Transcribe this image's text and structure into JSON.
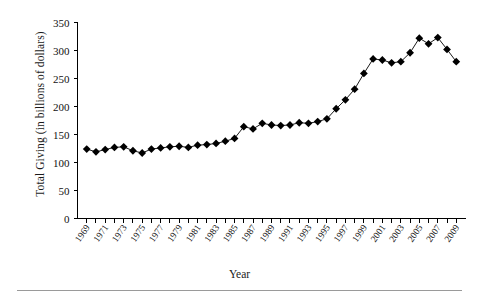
{
  "chart_data": {
    "type": "line",
    "title": "",
    "xlabel": "Year",
    "ylabel": "Total Giving (in billions of dollars)",
    "xlim": [
      1968,
      2010
    ],
    "ylim": [
      0,
      350
    ],
    "grid": false,
    "legend": null,
    "marker": "filled-diamond",
    "line_color": "#000000",
    "marker_color": "#000000",
    "y_ticks": [
      0,
      50,
      100,
      150,
      200,
      250,
      300,
      350
    ],
    "y_tick_labels": [
      "0",
      "50",
      "100",
      "150",
      "200",
      "250",
      "300",
      "350"
    ],
    "x_tick_labels": [
      "1969",
      "1971",
      "1973",
      "1975",
      "1977",
      "1979",
      "1981",
      "1983",
      "1985",
      "1987",
      "1989",
      "1991",
      "1993",
      "1995",
      "1997",
      "1999",
      "2001",
      "2003",
      "2005",
      "2007",
      "2009"
    ],
    "x_minor_tick_years": [
      1969,
      1970,
      1971,
      1972,
      1973,
      1974,
      1975,
      1976,
      1977,
      1978,
      1979,
      1980,
      1981,
      1982,
      1983,
      1984,
      1985,
      1986,
      1987,
      1988,
      1989,
      1990,
      1991,
      1992,
      1993,
      1994,
      1995,
      1996,
      1997,
      1998,
      1999,
      2000,
      2001,
      2002,
      2003,
      2004,
      2005,
      2006,
      2007,
      2008,
      2009
    ],
    "x": [
      1969,
      1970,
      1971,
      1972,
      1973,
      1974,
      1975,
      1976,
      1977,
      1978,
      1979,
      1980,
      1981,
      1982,
      1983,
      1984,
      1985,
      1986,
      1987,
      1988,
      1989,
      1990,
      1991,
      1992,
      1993,
      1994,
      1995,
      1996,
      1997,
      1998,
      1999,
      2000,
      2001,
      2002,
      2003,
      2004,
      2005,
      2006,
      2007,
      2008,
      2009
    ],
    "values": [
      124,
      119,
      123,
      127,
      128,
      121,
      117,
      124,
      126,
      128,
      129,
      127,
      131,
      132,
      134,
      138,
      143,
      164,
      160,
      170,
      167,
      166,
      167,
      171,
      170,
      173,
      178,
      196,
      212,
      231,
      259,
      285,
      283,
      278,
      280,
      296,
      322,
      312,
      323,
      302,
      280
    ]
  }
}
